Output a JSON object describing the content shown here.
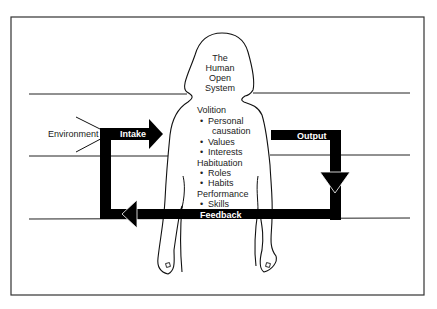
{
  "diagram": {
    "type": "model-of-human-occupation-open-system",
    "figure_title": [
      "The",
      "Human",
      "Open",
      "System"
    ],
    "environment_label": "Environment",
    "arrows": {
      "intake": "Intake",
      "output": "Output",
      "feedback": "Feedback"
    },
    "subsystems": [
      {
        "name": "Volition",
        "items": [
          "Personal",
          "causation",
          "Values",
          "Interests"
        ]
      },
      {
        "name": "Habituation",
        "items": [
          "Roles",
          "Habits"
        ]
      },
      {
        "name": "Performance",
        "items": [
          "Skills"
        ]
      }
    ],
    "bullet": "•",
    "colors": {
      "stroke": "#1a1a1a",
      "arrow_fill": "#000000",
      "background": "#ffffff"
    }
  }
}
